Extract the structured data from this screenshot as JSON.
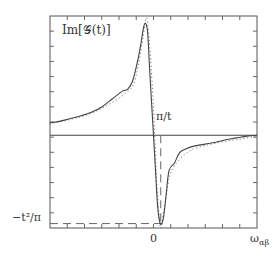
{
  "chart_data": {
    "type": "line",
    "title": "Im[𝒢(t)]",
    "xlabel": "ω_αβ",
    "ylabel": "",
    "x_tick_labels": [
      "0"
    ],
    "annotations": {
      "zero_crossing_marker": "π/t",
      "minimum_level_label": "−t²/π"
    },
    "xlim": [
      -1,
      1
    ],
    "ylim": [
      -1.05,
      1.35
    ],
    "zero_line": true,
    "grid": false,
    "legend": "none",
    "series": [
      {
        "name": "exact",
        "style": "solid",
        "x": [
          -1.0,
          -0.9,
          -0.8,
          -0.7,
          -0.6,
          -0.5,
          -0.4,
          -0.3,
          -0.25,
          -0.2,
          -0.15,
          -0.12,
          -0.1,
          -0.08,
          -0.06,
          -0.05,
          -0.04,
          -0.02,
          0.0,
          0.02,
          0.04,
          0.06,
          0.08,
          0.1,
          0.12,
          0.15,
          0.2,
          0.25,
          0.3,
          0.4,
          0.5,
          0.6,
          0.7,
          0.8,
          0.9,
          1.0
        ],
        "y": [
          0.14,
          0.16,
          0.19,
          0.22,
          0.26,
          0.32,
          0.41,
          0.5,
          0.52,
          0.62,
          0.86,
          1.05,
          1.2,
          1.27,
          1.2,
          1.05,
          0.8,
          0.4,
          0.0,
          -0.42,
          -0.8,
          -0.98,
          -1.0,
          -0.9,
          -0.7,
          -0.4,
          -0.32,
          -0.2,
          -0.16,
          -0.12,
          -0.1,
          -0.08,
          -0.05,
          -0.03,
          -0.01,
          0.0
        ]
      },
      {
        "name": "approximation",
        "style": "dotted",
        "x": [
          -1.0,
          -0.8,
          -0.6,
          -0.4,
          -0.3,
          -0.2,
          -0.15,
          -0.1,
          -0.07,
          -0.05,
          -0.03,
          0.0,
          0.03,
          0.05,
          0.07,
          0.1,
          0.15,
          0.2,
          0.3,
          0.4,
          0.6,
          0.8,
          1.0
        ],
        "y": [
          0.13,
          0.18,
          0.25,
          0.37,
          0.45,
          0.56,
          0.78,
          1.12,
          1.33,
          1.2,
          0.9,
          0.3,
          -0.5,
          -0.85,
          -1.05,
          -0.85,
          -0.5,
          -0.35,
          -0.22,
          -0.15,
          -0.09,
          -0.05,
          -0.01
        ]
      }
    ],
    "guides": {
      "vertical_dashed_x": 0.07,
      "horizontal_dashed_y": -1.0
    }
  }
}
